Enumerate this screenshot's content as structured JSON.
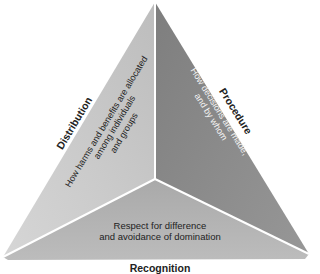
{
  "diagram": {
    "type": "triangle-three-facets",
    "colors": {
      "left_panel": "#c8c8c8",
      "right_panel": "#8a8a8a",
      "bottom_panel": "#b2b2b2",
      "divider": "#ffffff"
    },
    "facets": [
      {
        "id": "distribution",
        "title": "Distribution",
        "description_lines": [
          "How harms and benefits are allocated",
          "among individuals",
          "and groups"
        ]
      },
      {
        "id": "procedure",
        "title": "Procedure",
        "description_lines": [
          "How decisions are made,",
          "and by whom"
        ]
      },
      {
        "id": "recognition",
        "title": "Recognition",
        "description_lines": [
          "Respect for difference",
          "and avoidance of domination"
        ]
      }
    ]
  }
}
